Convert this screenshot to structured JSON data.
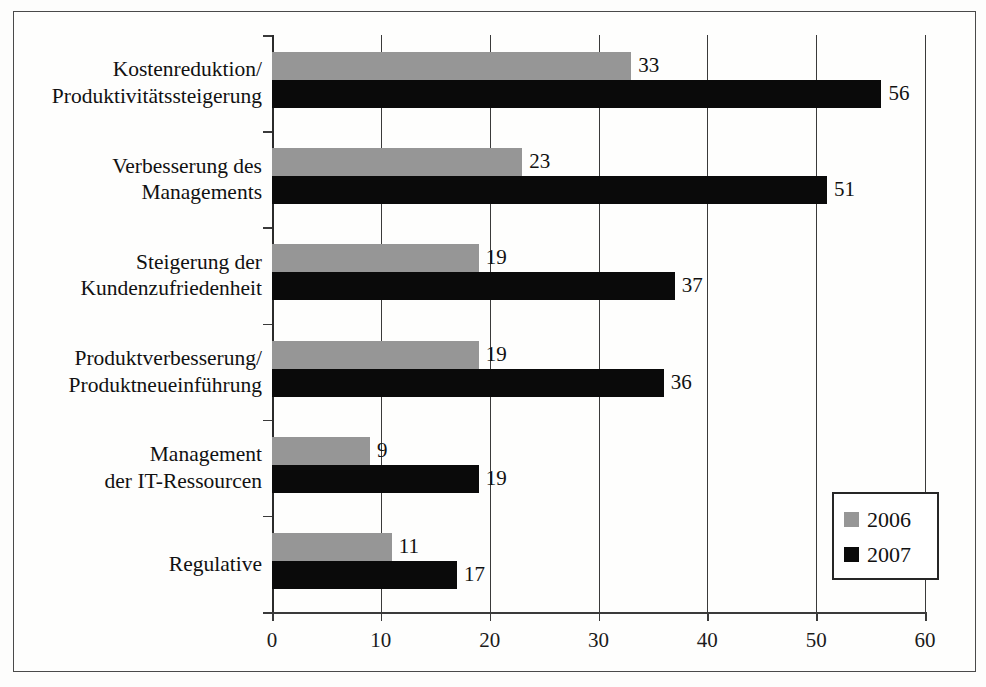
{
  "chart_data": {
    "type": "bar",
    "orientation": "horizontal",
    "title": "",
    "xlabel": "",
    "ylabel": "",
    "xlim": [
      0,
      60
    ],
    "xticks": [
      0,
      10,
      20,
      30,
      40,
      50,
      60
    ],
    "grid": true,
    "legend_position": "bottom-right",
    "categories": [
      "Kostenreduktion/\nProduktivitätssteigerung",
      "Verbesserung des\nManagements",
      "Steigerung der\nKundenzufriedenheit",
      "Produktverbesserung/\nProduktneueinführung",
      "Management\nder IT-Ressourcen",
      "Regulative"
    ],
    "series": [
      {
        "name": "2006",
        "color": "#969696",
        "values": [
          33,
          23,
          19,
          19,
          9,
          11
        ]
      },
      {
        "name": "2007",
        "color": "#0a0a0a",
        "values": [
          56,
          51,
          37,
          36,
          19,
          17
        ]
      }
    ]
  },
  "categories_display": [
    {
      "line1": "Kostenreduktion/",
      "line2": "Produktivitätssteigerung"
    },
    {
      "line1": "Verbesserung des",
      "line2": "Managements"
    },
    {
      "line1": "Steigerung der",
      "line2": "Kundenzufriedenheit"
    },
    {
      "line1": "Produktverbesserung/",
      "line2": "Produktneueinführung"
    },
    {
      "line1": "Management",
      "line2": "der IT-Ressourcen"
    },
    {
      "line1": "Regulative",
      "line2": ""
    }
  ],
  "axis": {
    "ticks": [
      "0",
      "10",
      "20",
      "30",
      "40",
      "50",
      "60"
    ]
  },
  "values_2006": [
    "33",
    "23",
    "19",
    "19",
    "9",
    "11"
  ],
  "values_2007": [
    "56",
    "51",
    "37",
    "36",
    "19",
    "17"
  ],
  "legend": {
    "entries": [
      {
        "label": "2006",
        "color": "#969696"
      },
      {
        "label": "2007",
        "color": "#0a0a0a"
      }
    ]
  }
}
